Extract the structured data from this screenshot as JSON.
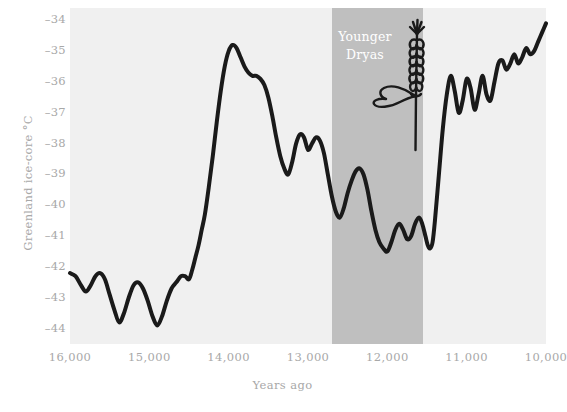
{
  "chart_data": {
    "type": "line",
    "title": "",
    "xlabel": "Years ago",
    "ylabel": "Greenland ice-core °C",
    "xlim": [
      16000,
      10000
    ],
    "xticks": [
      16000,
      15000,
      14000,
      13000,
      12000,
      11000,
      10000
    ],
    "xtick_labels": [
      "16,000",
      "15,000",
      "14,000",
      "13,000",
      "12,000",
      "11,000",
      "10,000"
    ],
    "ylim": [
      -44.5,
      -33.6
    ],
    "yticks": [
      -34,
      -35,
      -36,
      -37,
      -38,
      -39,
      -40,
      -41,
      -42,
      -43,
      -44
    ],
    "ytick_labels": [
      "–34",
      "–35",
      "–36",
      "–37",
      "–38",
      "–39",
      "–40",
      "–41",
      "–42",
      "–43",
      "–44"
    ],
    "grid": false,
    "legend": null,
    "line_color": "#1a1a1a",
    "line_width": 4.0,
    "plot_background": "#f0f0f0",
    "figure_background": "#ffffff",
    "tick_color": "#a8a8a8",
    "annotations": [
      {
        "name": "younger-dryas-band",
        "type": "vspan",
        "label": "Younger\nDryas",
        "label_line1": "Younger",
        "label_line2": "Dryas",
        "x_start": 12700,
        "x_end": 11550,
        "color": "#bfbfbf",
        "label_color": "#ffffff"
      },
      {
        "name": "wheat-stalk-icon",
        "type": "illustration",
        "description": "wheat stalk with leaf marking onset of agriculture",
        "x": 11500,
        "y": -35.2
      }
    ],
    "series": [
      {
        "name": "Greenland ice-core temperature",
        "color": "#1a1a1a",
        "x": [
          16000,
          15930,
          15860,
          15800,
          15740,
          15680,
          15620,
          15560,
          15500,
          15440,
          15380,
          15320,
          15260,
          15200,
          15140,
          15080,
          15020,
          14960,
          14900,
          14840,
          14780,
          14720,
          14660,
          14600,
          14550,
          14500,
          14460,
          14420,
          14380,
          14340,
          14300,
          14250,
          14200,
          14150,
          14100,
          14050,
          14000,
          13950,
          13900,
          13850,
          13800,
          13750,
          13700,
          13650,
          13600,
          13550,
          13500,
          13450,
          13400,
          13350,
          13300,
          13250,
          13200,
          13150,
          13100,
          13050,
          13000,
          12950,
          12900,
          12850,
          12800,
          12750,
          12700,
          12650,
          12600,
          12550,
          12500,
          12450,
          12400,
          12350,
          12300,
          12250,
          12200,
          12150,
          12100,
          12050,
          12000,
          11950,
          11900,
          11850,
          11800,
          11750,
          11700,
          11650,
          11600,
          11560,
          11520,
          11490,
          11460,
          11430,
          11400,
          11350,
          11300,
          11250,
          11200,
          11150,
          11100,
          11050,
          11000,
          10950,
          10900,
          10850,
          10800,
          10750,
          10700,
          10650,
          10600,
          10550,
          10500,
          10450,
          10400,
          10350,
          10300,
          10250,
          10200,
          10150,
          10100,
          10050,
          10000
        ],
        "y": [
          -42.2,
          -42.3,
          -42.6,
          -42.8,
          -42.6,
          -42.3,
          -42.2,
          -42.4,
          -42.9,
          -43.4,
          -43.8,
          -43.5,
          -43.0,
          -42.6,
          -42.5,
          -42.7,
          -43.1,
          -43.6,
          -43.9,
          -43.6,
          -43.1,
          -42.7,
          -42.5,
          -42.3,
          -42.3,
          -42.4,
          -42.1,
          -41.7,
          -41.3,
          -40.8,
          -40.3,
          -39.4,
          -38.4,
          -37.3,
          -36.3,
          -35.5,
          -35.0,
          -34.8,
          -34.9,
          -35.2,
          -35.5,
          -35.7,
          -35.8,
          -35.8,
          -35.9,
          -36.1,
          -36.5,
          -37.1,
          -37.8,
          -38.4,
          -38.8,
          -39.0,
          -38.6,
          -38.0,
          -37.7,
          -37.8,
          -38.2,
          -38.0,
          -37.8,
          -37.9,
          -38.3,
          -39.0,
          -39.7,
          -40.2,
          -40.4,
          -40.1,
          -39.6,
          -39.2,
          -38.9,
          -38.8,
          -39.0,
          -39.5,
          -40.2,
          -40.8,
          -41.2,
          -41.4,
          -41.5,
          -41.2,
          -40.8,
          -40.6,
          -40.8,
          -41.1,
          -41.0,
          -40.6,
          -40.4,
          -40.6,
          -41.0,
          -41.3,
          -41.4,
          -41.2,
          -40.5,
          -39.0,
          -37.5,
          -36.4,
          -35.8,
          -36.3,
          -37.0,
          -36.6,
          -35.9,
          -36.2,
          -36.9,
          -36.4,
          -35.8,
          -36.4,
          -36.6,
          -36.0,
          -35.4,
          -35.3,
          -35.6,
          -35.4,
          -35.1,
          -35.4,
          -35.2,
          -34.9,
          -35.1,
          -35.0,
          -34.7,
          -34.4,
          -34.1
        ]
      }
    ]
  }
}
